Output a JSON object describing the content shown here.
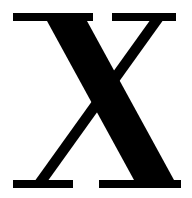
{
  "image": {
    "kind": "letterform-glyph",
    "width": 192,
    "height": 198,
    "background_color": "#ffffff",
    "alt_text": "X"
  },
  "glyph": {
    "character": "X",
    "name": "latin-capital-letter-x",
    "style": "serif",
    "typeface_class": "transitional-serif",
    "case": "uppercase",
    "fill_color": "#000000",
    "stroke_contrast": "high",
    "has_serifs": true,
    "serif_count": 4,
    "bounds": {
      "left": 13,
      "top": 13,
      "right": 181,
      "bottom": 188
    },
    "crossing_point": {
      "x": 95,
      "y": 100
    },
    "strokes": [
      {
        "name": "thick-diagonal",
        "direction": "top-left-to-bottom-right",
        "weight": "thick",
        "approx_width_px": 40
      },
      {
        "name": "thin-diagonal",
        "direction": "bottom-left-to-top-right",
        "weight": "thin",
        "approx_width_px": 13
      }
    ],
    "serifs": [
      {
        "name": "serif-top-left",
        "x1": 13,
        "x2": 93,
        "y1": 13,
        "y2": 21
      },
      {
        "name": "serif-top-right",
        "x1": 112,
        "x2": 176,
        "y1": 13,
        "y2": 21
      },
      {
        "name": "serif-bottom-left",
        "x1": 13,
        "x2": 73,
        "y1": 180,
        "y2": 188
      },
      {
        "name": "serif-bottom-right",
        "x1": 99,
        "x2": 181,
        "y1": 180,
        "y2": 188
      }
    ]
  }
}
